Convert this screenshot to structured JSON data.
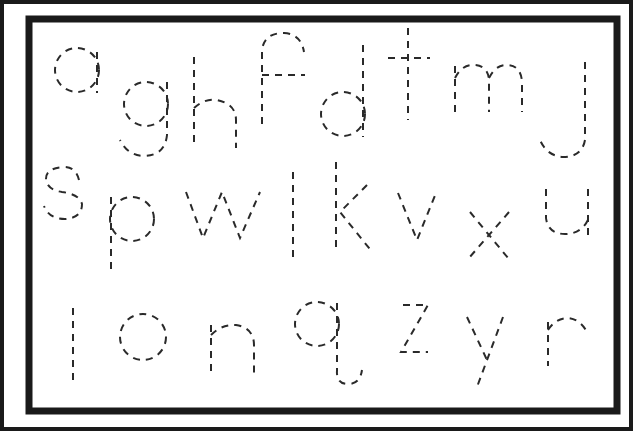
{
  "worksheet": {
    "title": "Lowercase letter tracing worksheet",
    "stroke_color": "#2a2a2a",
    "frame_color": "#1a1a1a",
    "background": "#ffffff",
    "rows": [
      {
        "letters": [
          "a",
          "g",
          "h",
          "f",
          "d",
          "t",
          "m",
          "j"
        ]
      },
      {
        "letters": [
          "s",
          "p",
          "w",
          "l",
          "k",
          "v",
          "x",
          "u"
        ]
      },
      {
        "letters": [
          "l",
          "o",
          "n",
          "q",
          "z",
          "y",
          "r"
        ]
      }
    ]
  }
}
